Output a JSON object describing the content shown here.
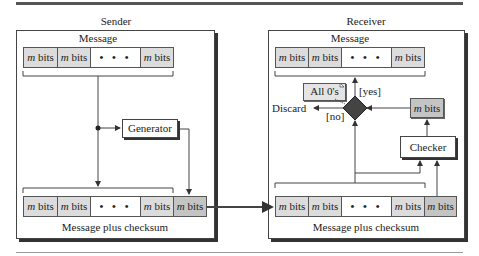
{
  "sender": {
    "title": "Sender",
    "message_label": "Message",
    "message_cells": [
      {
        "var": "m",
        "text": " bits"
      },
      {
        "var": "m",
        "text": " bits"
      },
      {
        "var": "",
        "text": "• • •"
      },
      {
        "var": "m",
        "text": " bits"
      }
    ],
    "generator_label": "Generator",
    "output_cells": [
      {
        "var": "m",
        "text": " bits"
      },
      {
        "var": "m",
        "text": " bits"
      },
      {
        "var": "",
        "text": "• • •"
      },
      {
        "var": "m",
        "text": " bits"
      },
      {
        "var": "m",
        "text": " bits"
      }
    ],
    "output_label": "Message plus checksum"
  },
  "receiver": {
    "title": "Receiver",
    "message_label": "Message",
    "message_cells": [
      {
        "var": "m",
        "text": " bits"
      },
      {
        "var": "m",
        "text": " bits"
      },
      {
        "var": "",
        "text": "• • •"
      },
      {
        "var": "m",
        "text": " bits"
      }
    ],
    "note_label": "All 0's",
    "yes_label": "[yes]",
    "no_label": "[no]",
    "discard_label": "Discard",
    "result_cell": {
      "var": "m",
      "text": " bits"
    },
    "checker_label": "Checker",
    "input_cells": [
      {
        "var": "m",
        "text": " bits"
      },
      {
        "var": "m",
        "text": " bits"
      },
      {
        "var": "",
        "text": "• • •"
      },
      {
        "var": "m",
        "text": " bits"
      },
      {
        "var": "m",
        "text": " bits"
      }
    ],
    "input_label": "Message plus checksum"
  },
  "colors": {
    "cell_fill": "#dcdcdc",
    "checksum_fill": "#c4c4c4",
    "diamond_fill": "#444444",
    "rule": "#555555"
  }
}
